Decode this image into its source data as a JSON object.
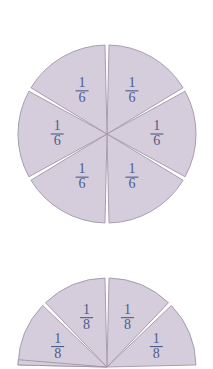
{
  "figure": {
    "background_color": "#ffffff",
    "wedge_fill_color": "#d6cddc",
    "wedge_stroke_color": "#9f95a8",
    "label_text_color": "#4b5c8c",
    "separator_color": "#ffffff"
  },
  "circles": [
    {
      "name": "sixths-circle",
      "denominator": 6,
      "slice_count": 6,
      "center_x": 107,
      "center_y": 134,
      "radius": 89,
      "gap_degrees": 2.6,
      "slices": [
        {
          "label_numerator": "1",
          "label_denominator": "6",
          "start_angle": -90,
          "end_angle": -30,
          "label_radius": 0.56
        },
        {
          "label_numerator": "1",
          "label_denominator": "6",
          "start_angle": -30,
          "end_angle": 30,
          "label_radius": 0.56
        },
        {
          "label_numerator": "1",
          "label_denominator": "6",
          "start_angle": 30,
          "end_angle": 90,
          "label_radius": 0.56
        },
        {
          "label_numerator": "1",
          "label_denominator": "6",
          "start_angle": 90,
          "end_angle": 150,
          "label_radius": 0.56
        },
        {
          "label_numerator": "1",
          "label_denominator": "6",
          "start_angle": 150,
          "end_angle": 210,
          "label_radius": 0.56
        },
        {
          "label_numerator": "1",
          "label_denominator": "6",
          "start_angle": 210,
          "end_angle": 270,
          "label_radius": 0.56
        }
      ]
    },
    {
      "name": "eighths-circle",
      "denominator": 8,
      "slice_count": 5,
      "center_x": 107,
      "center_y": 367,
      "radius": 89,
      "gap_degrees": 2.6,
      "slices": [
        {
          "label_numerator": "1",
          "label_denominator": "8",
          "start_angle": -90,
          "end_angle": -45,
          "label_radius": 0.6
        },
        {
          "label_numerator": "1",
          "label_denominator": "8",
          "start_angle": -45,
          "end_angle": 0,
          "label_radius": 0.6
        },
        {
          "label_numerator": "1",
          "label_denominator": "8",
          "start_angle": -135,
          "end_angle": -90,
          "label_radius": 0.6
        },
        {
          "label_numerator": "1",
          "label_denominator": "8",
          "start_angle": -180,
          "end_angle": -135,
          "label_radius": 0.6
        },
        {
          "label_numerator": "",
          "label_denominator": "",
          "start_angle": 180,
          "end_angle": 186,
          "label_radius": 0.6
        }
      ]
    }
  ]
}
